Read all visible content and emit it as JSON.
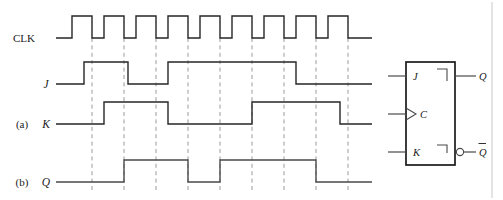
{
  "figure": {
    "width": 503,
    "height": 200,
    "background_color": "#ffffff",
    "signal_color": "#262626",
    "grid_color": "#9a9a9a",
    "symbol_color": "#1a1a1a"
  },
  "part_labels": {
    "a": "(a)",
    "b": "(b)"
  },
  "waveforms": [
    {
      "name": "clk",
      "label": "CLK",
      "label_style": "roman",
      "label_x": 24,
      "label_y": 42,
      "baseline_y": 38,
      "high_y": 16,
      "start_x": 56,
      "end_x": 372,
      "initial_level": 0,
      "transitions_x": [
        72,
        92,
        104,
        124,
        136,
        156,
        168,
        188,
        200,
        220,
        232,
        252,
        264,
        284,
        296,
        316,
        328,
        348
      ],
      "pulse_count": 9,
      "period_px": 32,
      "high_width_px": 20
    },
    {
      "name": "j",
      "label": "J",
      "label_style": "italic",
      "label_x": 46,
      "label_y": 88,
      "baseline_y": 84,
      "high_y": 62,
      "start_x": 56,
      "end_x": 372,
      "initial_level": 0,
      "transitions_x": [
        84,
        128,
        168,
        296
      ]
    },
    {
      "name": "k",
      "label": "K",
      "label_style": "italic",
      "label_x": 46,
      "label_y": 128,
      "baseline_y": 124,
      "high_y": 102,
      "start_x": 56,
      "end_x": 372,
      "initial_level": 0,
      "transitions_x": [
        104,
        168,
        252,
        340
      ]
    },
    {
      "name": "q",
      "label": "Q",
      "label_style": "italic",
      "label_x": 46,
      "label_y": 186,
      "baseline_y": 182,
      "high_y": 160,
      "start_x": 56,
      "end_x": 372,
      "initial_level": 0,
      "transitions_x": [
        124,
        188,
        220,
        316
      ]
    }
  ],
  "grid": {
    "description": "vertical dashed clock-edge reference lines",
    "top_y": 38,
    "bottom_y": 190,
    "x_positions": [
      92,
      124,
      156,
      188,
      220,
      252,
      284,
      316,
      348
    ]
  },
  "flipflop": {
    "name": "jk-flip-flop",
    "box": {
      "x": 406,
      "y": 62,
      "width": 49,
      "height": 103
    },
    "inputs": [
      {
        "name": "j-input",
        "label": "J",
        "y": 76,
        "wire_x1": 388,
        "wire_x2": 406
      },
      {
        "name": "clock-input",
        "label": "C",
        "y": 114,
        "wire_x1": 388,
        "wire_x2": 406,
        "dynamic_indicator": true
      },
      {
        "name": "k-input",
        "label": "K",
        "y": 152,
        "wire_x1": 388,
        "wire_x2": 406
      }
    ],
    "outputs": [
      {
        "name": "q-output",
        "label": "Q",
        "y": 76,
        "wire_x1": 455,
        "wire_x2": 476,
        "inverted": false
      },
      {
        "name": "q-bar-output",
        "label": "Q",
        "y": 152,
        "wire_x1": 455,
        "wire_x2": 476,
        "inverted": true,
        "overbar": true
      }
    ]
  },
  "page_border": {
    "visible": true,
    "x": 492,
    "y1": 2,
    "y2": 198
  }
}
